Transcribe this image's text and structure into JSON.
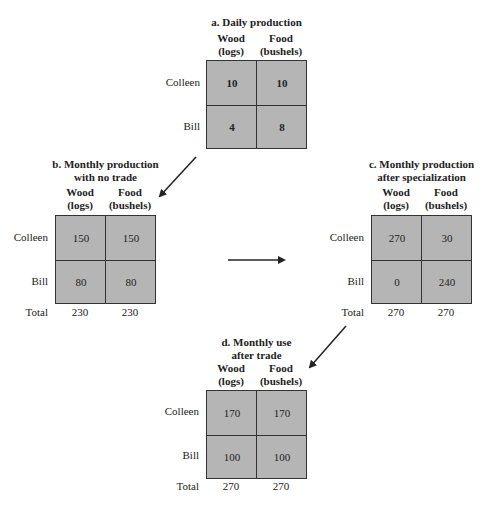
{
  "columns": {
    "wood": {
      "line1": "Wood",
      "line2": "(logs)"
    },
    "food": {
      "line1": "Food",
      "line2": "(bushels)"
    }
  },
  "row_labels": {
    "colleen": "Colleen",
    "bill": "Bill",
    "total": "Total"
  },
  "panels": {
    "a": {
      "title_line1": "a. Daily production",
      "colleen": {
        "wood": "10",
        "food": "10"
      },
      "bill": {
        "wood": "4",
        "food": "8"
      }
    },
    "b": {
      "title_line1": "b. Monthly production",
      "title_line2": "with no trade",
      "colleen": {
        "wood": "150",
        "food": "150"
      },
      "bill": {
        "wood": "80",
        "food": "80"
      },
      "total": {
        "wood": "230",
        "food": "230"
      }
    },
    "c": {
      "title_line1": "c. Monthly production",
      "title_line2": "after specialization",
      "colleen": {
        "wood": "270",
        "food": "30"
      },
      "bill": {
        "wood": "0",
        "food": "240"
      },
      "total": {
        "wood": "270",
        "food": "270"
      }
    },
    "d": {
      "title_line1": "d. Monthly use",
      "title_line2": "after trade",
      "colleen": {
        "wood": "170",
        "food": "170"
      },
      "bill": {
        "wood": "100",
        "food": "100"
      },
      "total": {
        "wood": "270",
        "food": "270"
      }
    }
  },
  "colors": {
    "cell_fill": "#b5b5b5",
    "grid_line": "#333333",
    "arrow": "#222222"
  }
}
